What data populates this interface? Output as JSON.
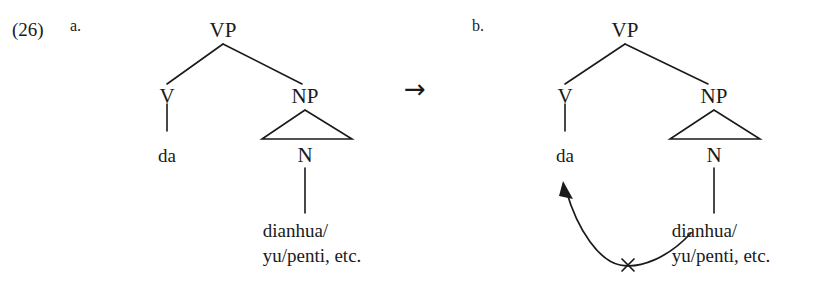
{
  "figure": {
    "example_number": "(26)",
    "transform_arrow": "→",
    "background_color": "#ffffff",
    "ink_color": "#1a1a1a"
  },
  "trees": [
    {
      "letter": "a.",
      "nodes": {
        "root": "VP",
        "left_child": "V",
        "right_child": "NP",
        "np_head": "N"
      },
      "terminals": {
        "verb": "da",
        "noun_line1": "dianhua/",
        "noun_line2": "yu/penti, etc."
      },
      "has_movement_arrow": false
    },
    {
      "letter": "b.",
      "nodes": {
        "root": "VP",
        "left_child": "V",
        "right_child": "NP",
        "np_head": "N"
      },
      "terminals": {
        "verb": "da",
        "noun_line1": "dianhua/",
        "noun_line2": "yu/penti, etc."
      },
      "has_movement_arrow": true,
      "movement_arrow": {
        "cross_mark": "×",
        "meaning": "blocked-movement"
      }
    }
  ]
}
